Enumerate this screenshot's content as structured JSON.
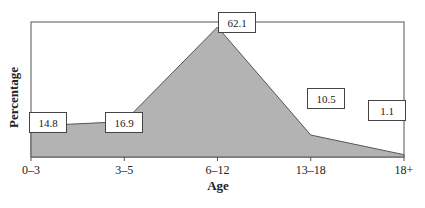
{
  "chart_data": {
    "type": "area",
    "title": "",
    "xlabel": "Age",
    "ylabel": "Percentage",
    "categories": [
      "0–3",
      "3–5",
      "6–12",
      "13–18",
      "18+"
    ],
    "values": [
      14.8,
      16.9,
      62.1,
      10.5,
      1.1
    ],
    "data_labels": [
      "14.8",
      "16.9",
      "62.1",
      "10.5",
      "1.1"
    ],
    "ylim": [
      0,
      70
    ],
    "grid": false,
    "legend": "none",
    "fill_color": "#b3b3b3",
    "line_color": "#555555"
  }
}
